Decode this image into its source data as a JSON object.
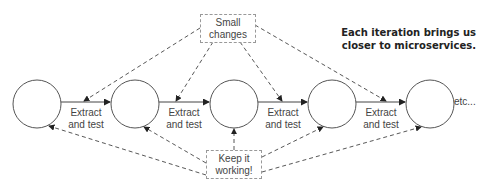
{
  "diagram": {
    "note": {
      "line1": "Each iteration brings us",
      "line2": "closer to microservices."
    },
    "top_box": {
      "line1": "Small",
      "line2": "changes"
    },
    "bottom_box": {
      "line1": "Keep it",
      "line2": "working!"
    },
    "steps": [
      {
        "line1": "Extract",
        "line2": "and test"
      },
      {
        "line1": "Extract",
        "line2": "and test"
      },
      {
        "line1": "Extract",
        "line2": "and test"
      },
      {
        "line1": "Extract",
        "line2": "and test"
      }
    ],
    "trailing": "etc...",
    "node_count": 5
  }
}
